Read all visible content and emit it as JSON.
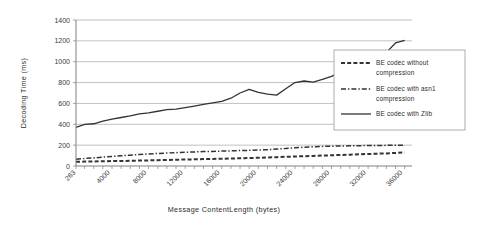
{
  "chart_data": {
    "type": "line",
    "title": "",
    "xlabel": "Message ContentLength (bytes)",
    "ylabel": "Decoding Time (ms)",
    "xlim": [
      263,
      37000
    ],
    "ylim": [
      0,
      1400
    ],
    "ytick_values": [
      0,
      200,
      400,
      600,
      800,
      1000,
      1200,
      1400
    ],
    "ytick_labels": [
      "0",
      "200",
      "400",
      "600",
      "800",
      "1000",
      "1200",
      "1400"
    ],
    "xtick_values": [
      263,
      4000,
      8000,
      12000,
      16000,
      20000,
      24000,
      28000,
      32000,
      36000
    ],
    "xtick_labels": [
      "263",
      "4000",
      "8000",
      "12000",
      "16000",
      "20000",
      "24000",
      "28000",
      "32000",
      "36000"
    ],
    "grid": "horizontal",
    "legend_position": "right-inside",
    "x": [
      263,
      1200,
      2200,
      3200,
      4200,
      5200,
      6200,
      7200,
      8200,
      9200,
      10200,
      11200,
      12200,
      13200,
      14200,
      15200,
      16200,
      17200,
      18200,
      19200,
      20200,
      21200,
      22200,
      23200,
      24200,
      25200,
      26200,
      27200,
      28200,
      29200,
      30200,
      31200,
      32200,
      33200,
      34200,
      35200,
      36200
    ],
    "series": [
      {
        "name": "BE codec without compression",
        "style": "dashed",
        "color": "#1a1a1a",
        "values": [
          40,
          42,
          44,
          45,
          47,
          48,
          50,
          52,
          54,
          56,
          58,
          60,
          62,
          64,
          66,
          68,
          70,
          72,
          74,
          76,
          79,
          82,
          85,
          88,
          91,
          94,
          97,
          100,
          103,
          106,
          109,
          112,
          115,
          118,
          121,
          125,
          130
        ]
      },
      {
        "name": "BE codec with asn1 compression",
        "style": "dash-dot",
        "color": "#3a3a3a",
        "values": [
          65,
          72,
          78,
          85,
          92,
          98,
          104,
          110,
          116,
          120,
          125,
          128,
          132,
          135,
          138,
          140,
          143,
          145,
          148,
          150,
          153,
          157,
          162,
          168,
          174,
          180,
          185,
          188,
          190,
          192,
          193,
          195,
          196,
          197,
          198,
          199,
          200
        ]
      },
      {
        "name": "BE codec with Zlib",
        "style": "solid",
        "color": "#3a3a3a",
        "values": [
          370,
          400,
          405,
          430,
          450,
          465,
          480,
          500,
          510,
          525,
          540,
          545,
          560,
          575,
          590,
          605,
          620,
          650,
          700,
          735,
          705,
          690,
          680,
          740,
          800,
          815,
          805,
          830,
          860,
          900,
          950,
          990,
          1010,
          1060,
          1090,
          1180,
          1205
        ]
      }
    ],
    "legend_entries": [
      {
        "label_line1": "BE codec without",
        "label_line2": "compression",
        "style": "dashed"
      },
      {
        "label_line1": "BE codec with asn1",
        "label_line2": "compression",
        "style": "dash-dot"
      },
      {
        "label_line1": "BE codec with Zlib",
        "label_line2": "",
        "style": "solid"
      }
    ]
  }
}
